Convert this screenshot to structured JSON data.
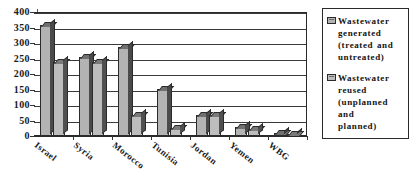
{
  "chart_data": {
    "type": "bar",
    "title": "",
    "subtitle": "",
    "xlabel": "",
    "ylabel": "",
    "ylim": [
      0,
      400
    ],
    "ytick_step": 50,
    "yticks": [
      400,
      350,
      300,
      250,
      200,
      150,
      100,
      50,
      0
    ],
    "grid": true,
    "grid_axis": "y",
    "legend_position": "right",
    "style": "3d-bar-grayscale",
    "categories": [
      "Israel",
      "Syria",
      "Morocco",
      "Tunisia",
      "Jordan",
      "Yemen",
      "WBG"
    ],
    "series": [
      {
        "name": "Wastewater generated (treated and untreated)",
        "color": "#b3b3b3",
        "values": [
          358,
          256,
          286,
          153,
          67,
          29,
          10
        ]
      },
      {
        "name": "Wastewater reused (unplanned and planned)",
        "color": "#bdbdbd",
        "values": [
          238,
          240,
          68,
          27,
          69,
          23,
          4
        ]
      }
    ]
  },
  "legend": {
    "entries": [
      {
        "swatch": "series-1-swatch",
        "lines": [
          "Wastewater",
          "generated",
          "(treated and",
          "untreated)"
        ]
      },
      {
        "swatch": "series-2-swatch",
        "lines": [
          "Wastewater",
          "reused",
          "(unplanned",
          "and",
          "planned)"
        ]
      }
    ]
  }
}
